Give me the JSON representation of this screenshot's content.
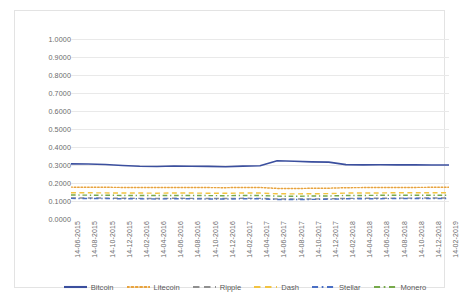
{
  "chart_data": {
    "type": "line",
    "title": "",
    "xlabel": "",
    "ylabel": "",
    "ylim": [
      0.0,
      1.0
    ],
    "grid": true,
    "legend_position": "bottom",
    "y_ticks": [
      "0.0000",
      "0.1000",
      "0.2000",
      "0.3000",
      "0.4000",
      "0.5000",
      "0.6000",
      "0.7000",
      "0.8000",
      "0.9000",
      "1.0000"
    ],
    "categories": [
      "14-06-2015",
      "14-08-2015",
      "14-10-2015",
      "14-12-2015",
      "14-02-2016",
      "14-04-2016",
      "14-06-2016",
      "14-08-2016",
      "14-10-2016",
      "14-12-2016",
      "14-02-2017",
      "14-04-2017",
      "14-06-2017",
      "14-08-2017",
      "14-10-2017",
      "14-12-2017",
      "14-02-2018",
      "14-04-2018",
      "14-06-2018",
      "14-08-2018",
      "14-10-2018",
      "14-12-2018",
      "14-02-2019"
    ],
    "series": [
      {
        "name": "Bitcoin",
        "color": "#3b4f9e",
        "style": "solid",
        "values": [
          0.306,
          0.3055,
          0.303,
          0.2975,
          0.293,
          0.292,
          0.2945,
          0.293,
          0.2925,
          0.2905,
          0.2935,
          0.296,
          0.3235,
          0.321,
          0.3175,
          0.316,
          0.302,
          0.3005,
          0.301,
          0.3005,
          0.3005,
          0.3,
          0.3
        ]
      },
      {
        "name": "Litecoin",
        "color": "#e8a33d",
        "style": "dotted",
        "values": [
          0.177,
          0.1765,
          0.176,
          0.1755,
          0.175,
          0.1745,
          0.1755,
          0.175,
          0.1745,
          0.174,
          0.1755,
          0.175,
          0.17,
          0.1695,
          0.1705,
          0.171,
          0.174,
          0.1745,
          0.175,
          0.1755,
          0.1755,
          0.176,
          0.176
        ]
      },
      {
        "name": "Ripple",
        "color": "#8f8f8f",
        "style": "dashed",
        "values": [
          0.117,
          0.1165,
          0.116,
          0.115,
          0.1145,
          0.114,
          0.115,
          0.1145,
          0.114,
          0.1135,
          0.115,
          0.1145,
          0.111,
          0.1105,
          0.1115,
          0.112,
          0.1145,
          0.115,
          0.1155,
          0.116,
          0.116,
          0.1165,
          0.1165
        ]
      },
      {
        "name": "Dash",
        "color": "#f2c341",
        "style": "dashed",
        "values": [
          0.146,
          0.1455,
          0.145,
          0.1445,
          0.144,
          0.1435,
          0.1445,
          0.144,
          0.1435,
          0.143,
          0.1445,
          0.144,
          0.14,
          0.1395,
          0.1405,
          0.141,
          0.144,
          0.1445,
          0.145,
          0.1455,
          0.1455,
          0.146,
          0.146
        ]
      },
      {
        "name": "Stellar",
        "color": "#4a6fc4",
        "style": "dashdot",
        "values": [
          0.1145,
          0.114,
          0.1135,
          0.1125,
          0.112,
          0.1115,
          0.1125,
          0.112,
          0.1115,
          0.111,
          0.1125,
          0.112,
          0.1085,
          0.108,
          0.109,
          0.1095,
          0.112,
          0.1125,
          0.113,
          0.1135,
          0.1135,
          0.114,
          0.114
        ]
      },
      {
        "name": "Monero",
        "color": "#76a94a",
        "style": "dashdot",
        "values": [
          0.133,
          0.1325,
          0.132,
          0.131,
          0.1305,
          0.13,
          0.131,
          0.1305,
          0.13,
          0.1295,
          0.131,
          0.1305,
          0.127,
          0.1265,
          0.1275,
          0.128,
          0.1305,
          0.131,
          0.1315,
          0.132,
          0.132,
          0.1325,
          0.1325
        ]
      }
    ]
  }
}
